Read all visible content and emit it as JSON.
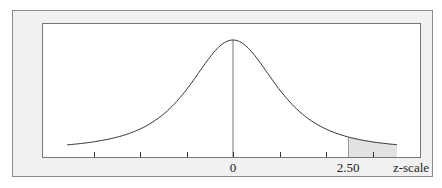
{
  "figure": {
    "type": "normal-distribution-diagram",
    "x_axis": {
      "label": "z-scale",
      "tick_labels": [
        {
          "value": 0,
          "text": "0"
        },
        {
          "value": 2.5,
          "text": "2.50"
        }
      ],
      "ticks": [
        -3,
        -2,
        -1,
        0,
        1,
        2,
        3
      ]
    },
    "shaded_region": {
      "from": 2.5,
      "to": "right tail",
      "color": "#e2e2e2"
    },
    "mean_line": {
      "at": 0
    },
    "colors": {
      "frame_fill": "#f1f1f1",
      "frame_border": "#8a8a8a",
      "plot_fill": "#ffffff",
      "curve": "#333333"
    }
  },
  "chart_data": {
    "type": "area",
    "title": "",
    "xlabel": "z-scale",
    "ylabel": "",
    "x_ticks": [
      -3,
      -2,
      -1,
      0,
      1,
      2,
      3
    ],
    "x_tick_labels": {
      "0": "0",
      "2.5": "2.50"
    },
    "xlim": [
      -3.6,
      3.5
    ],
    "series": [
      {
        "name": "density",
        "distribution": "standard normal (heavy-tailed depiction)"
      },
      {
        "name": "shaded tail",
        "x_from": 2.5,
        "x_to": 3.5
      }
    ],
    "annotations": [
      "vertical line at z = 0",
      "shaded area right of z = 2.50"
    ]
  }
}
